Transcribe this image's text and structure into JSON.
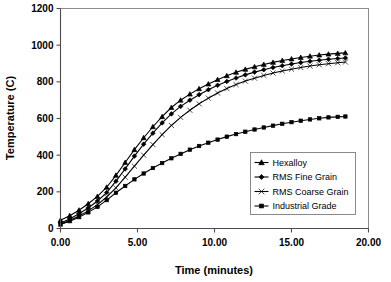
{
  "chart_data": {
    "type": "line",
    "title": "",
    "xlabel": "Time (minutes)",
    "ylabel": "Temperature (C)",
    "xlim": [
      0,
      20
    ],
    "ylim": [
      0,
      1200
    ],
    "xticks": [
      "0.00",
      "5.00",
      "10.00",
      "15.00",
      "20.00"
    ],
    "xtick_values": [
      0,
      5,
      10,
      15,
      20
    ],
    "yticks": [
      "0",
      "200",
      "400",
      "600",
      "800",
      "1000",
      "1200"
    ],
    "ytick_values": [
      0,
      200,
      400,
      600,
      800,
      1000,
      1200
    ],
    "grid": true,
    "legend_position": "lower-right",
    "series": [
      {
        "name": "Hexalloy",
        "marker": "triangle",
        "x": [
          0.0,
          0.6,
          1.2,
          1.8,
          2.4,
          3.0,
          3.6,
          4.2,
          4.8,
          5.4,
          6.0,
          6.6,
          7.2,
          7.8,
          8.4,
          9.0,
          9.6,
          10.2,
          10.8,
          11.4,
          12.0,
          12.6,
          13.2,
          13.8,
          14.4,
          15.0,
          15.6,
          16.2,
          16.8,
          17.4,
          18.0,
          18.5
        ],
        "y": [
          45,
          70,
          100,
          135,
          175,
          225,
          290,
          360,
          430,
          495,
          555,
          610,
          660,
          700,
          733,
          762,
          788,
          812,
          833,
          852,
          868,
          882,
          895,
          906,
          916,
          925,
          933,
          940,
          946,
          951,
          955,
          958
        ]
      },
      {
        "name": "RMS Fine Grain",
        "marker": "diamond",
        "x": [
          0.0,
          0.6,
          1.2,
          1.8,
          2.4,
          3.0,
          3.6,
          4.2,
          4.8,
          5.4,
          6.0,
          6.6,
          7.2,
          7.8,
          8.4,
          9.0,
          9.6,
          10.2,
          10.8,
          11.4,
          12.0,
          12.6,
          13.2,
          13.8,
          14.4,
          15.0,
          15.6,
          16.2,
          16.8,
          17.4,
          18.0,
          18.5
        ],
        "y": [
          30,
          52,
          80,
          112,
          150,
          196,
          258,
          325,
          395,
          460,
          520,
          576,
          625,
          666,
          700,
          730,
          757,
          781,
          802,
          821,
          838,
          853,
          866,
          878,
          888,
          897,
          905,
          912,
          918,
          923,
          927,
          930
        ]
      },
      {
        "name": "RMS Coarse Grain",
        "marker": "cross",
        "x": [
          0.0,
          0.6,
          1.2,
          1.8,
          2.4,
          3.0,
          3.6,
          4.2,
          4.8,
          5.4,
          6.0,
          6.6,
          7.2,
          7.8,
          8.4,
          9.0,
          9.6,
          10.2,
          10.8,
          11.4,
          12.0,
          12.6,
          13.2,
          13.8,
          14.4,
          15.0,
          15.6,
          16.2,
          16.8,
          17.4,
          18.0,
          18.5
        ],
        "y": [
          25,
          44,
          68,
          96,
          130,
          172,
          222,
          280,
          340,
          400,
          458,
          512,
          562,
          606,
          645,
          680,
          711,
          739,
          763,
          785,
          804,
          820,
          835,
          848,
          859,
          869,
          878,
          886,
          893,
          899,
          904,
          908
        ]
      },
      {
        "name": "Industrial Grade",
        "marker": "square",
        "x": [
          0.0,
          0.6,
          1.2,
          1.8,
          2.4,
          3.0,
          3.6,
          4.2,
          4.8,
          5.4,
          6.0,
          6.6,
          7.2,
          7.8,
          8.4,
          9.0,
          9.6,
          10.2,
          10.8,
          11.4,
          12.0,
          12.6,
          13.2,
          13.8,
          14.4,
          15.0,
          15.6,
          16.2,
          16.8,
          17.4,
          18.0,
          18.5
        ],
        "y": [
          22,
          40,
          62,
          88,
          118,
          155,
          195,
          232,
          268,
          300,
          330,
          357,
          383,
          407,
          430,
          450,
          468,
          485,
          501,
          515,
          528,
          540,
          551,
          561,
          571,
          580,
          588,
          595,
          601,
          606,
          609,
          611
        ]
      }
    ]
  }
}
